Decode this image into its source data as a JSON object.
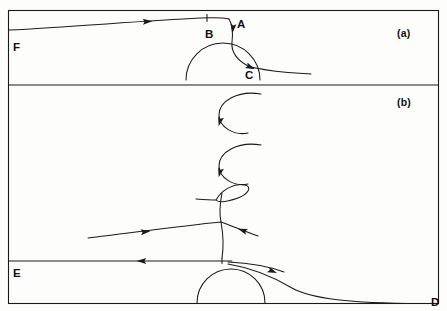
{
  "figure": {
    "background_color": "#fdfdfc",
    "line_color": "#1a1a1a",
    "frame": {
      "x": 8,
      "y": 10,
      "width": 431,
      "height": 294,
      "divider_y": 85
    }
  },
  "panels": [
    {
      "id": "a",
      "label": "(a)",
      "label_x": 397,
      "label_y": 28
    },
    {
      "id": "b",
      "label": "(b)",
      "label_x": 397,
      "label_y": 97
    }
  ],
  "point_labels": [
    {
      "name": "A",
      "text": "A",
      "x": 237,
      "y": 19,
      "panel": "a"
    },
    {
      "name": "B",
      "text": "B",
      "x": 205,
      "y": 29,
      "panel": "a"
    },
    {
      "name": "C",
      "text": "C",
      "x": 245,
      "y": 70,
      "panel": "a"
    },
    {
      "name": "D",
      "text": "D",
      "x": 431,
      "y": 297,
      "panel": "b"
    },
    {
      "name": "E",
      "text": "E",
      "x": 13,
      "y": 268,
      "panel": "b"
    },
    {
      "name": "F",
      "text": "F",
      "x": 13,
      "y": 42,
      "panel": "a"
    }
  ],
  "chart_data": {
    "type": "line",
    "xlabel": "",
    "ylabel": "",
    "grid": false,
    "legend": "none",
    "xlim": [
      8,
      439
    ],
    "ylim": [
      10,
      304
    ],
    "series": [
      {
        "name": "panel-a-incoming-streamline-F-to-B",
        "panel": "a",
        "description": "Nearly straight streamline entering at left edge at F, rising gently to the right toward B and the separation point A.",
        "path": "M 9 30 C 70 27, 140 21, 200 18 C 215 17.4, 224 17.6, 229 19",
        "arrow": {
          "x": 147,
          "y": 21.6,
          "angle": -3,
          "direction": "right"
        }
      },
      {
        "name": "panel-a-tick-at-B",
        "panel": "a",
        "description": "Short vertical tick mark crossing the streamline at point B.",
        "path": "M 207 14.5 L 207 21.5"
      },
      {
        "name": "panel-a-descending-stem-A-to-C",
        "panel": "a",
        "description": "Streamline turning sharply downward at A, descending past the bubble crest and curving to the right toward C.",
        "path": "M 229 19 C 233 25, 233 33, 232 42 C 231 52, 237 60, 248 66",
        "arrow": {
          "x": 233,
          "y": 28,
          "angle": 96,
          "direction": "down"
        }
      },
      {
        "name": "panel-a-separation-bubble",
        "panel": "a",
        "description": "Semicircular separation bubble sitting on the lower boundary of panel (a), spanning from x=186 to x=260.",
        "path": "M 186 80 A 37 37 0 0 1 260 80"
      },
      {
        "name": "panel-a-outgoing-streamline-C",
        "panel": "a",
        "description": "Streamline leaving the bubble at C and flattening out to the right, terminating short of the right frame edge.",
        "path": "M 248 66 C 258 69, 272 71, 288 72.5 C 297 73.3, 305 73.7, 311 73.9",
        "arrow": {
          "x": 250,
          "y": 67,
          "angle": 24,
          "direction": "right-down"
        }
      },
      {
        "name": "panel-b-upper-arc",
        "panel": "b",
        "description": "Upper C-shaped arc (open to the right) in panel (b), a rolled-up vortex filament.",
        "path": "M 261 94 C 238 90, 219 101, 219 115 C 219 127, 234 136, 248 133",
        "arrow": {
          "x": 220,
          "y": 121,
          "angle": 104,
          "direction": "down"
        }
      },
      {
        "name": "panel-b-middle-arc",
        "panel": "b",
        "description": "Middle C-shaped arc (open to the right) in panel (b), a second rolled-up vortex filament.",
        "path": "M 261 145 C 238 141, 219 152, 219 166 C 219 178, 234 187, 248 184",
        "arrow": {
          "x": 220,
          "y": 172,
          "angle": 104,
          "direction": "down"
        }
      },
      {
        "name": "panel-b-teardrop-loop",
        "panel": "b",
        "description": "Narrow teardrop-shaped loop tilted up to the right, formed where the sheet folds over on itself.",
        "path": "M 216 200 C 222 189, 235 183, 245 185 C 252 186.5, 249 194, 238 198 C 228 201.5, 219 203, 216 200 Z"
      },
      {
        "name": "panel-b-loop-inflow",
        "panel": "b",
        "description": "Line entering the teardrop loop from the left.",
        "path": "M 196 199 C 203 199.5, 210 200, 216 200"
      },
      {
        "name": "panel-b-loop-stem",
        "panel": "b",
        "description": "Stem descending from the teardrop loop down through the crossing point toward the lower bubble.",
        "path": "M 222 193 C 220 203, 219 213, 221 222 C 223 233, 224 245, 222 258"
      },
      {
        "name": "panel-b-long-incoming-line",
        "panel": "b",
        "description": "Long, nearly straight streamline entering from the left of panel (b) and rising to the crossing point below the loop.",
        "path": "M 88 238 C 130 233, 180 226, 221 222",
        "arrow": {
          "x": 145,
          "y": 231.8,
          "angle": -6,
          "direction": "right"
        }
      },
      {
        "name": "panel-b-right-branch",
        "panel": "b",
        "description": "Short branch leaving the crossing point toward the lower right, carrying a leftward-pointing arrowhead.",
        "path": "M 221 222 C 232 226, 244 231, 258 236",
        "arrow": {
          "x": 243,
          "y": 230.5,
          "angle": 200,
          "direction": "left"
        }
      },
      {
        "name": "panel-b-E-horizontal-line",
        "panel": "b",
        "description": "Horizontal streamline along the top of the lower bubble running to the left edge at E, with a left-pointing arrowhead.",
        "path": "M 9 261 L 232 261",
        "arrow": {
          "x": 142,
          "y": 261,
          "angle": 180,
          "direction": "left"
        }
      },
      {
        "name": "panel-b-tick-on-E-line",
        "panel": "b",
        "description": "Small tick mark on the E streamline just above the crest of the lower bubble.",
        "path": "M 222 258 L 222 263.5"
      },
      {
        "name": "panel-b-lower-bubble",
        "panel": "b",
        "description": "Large semicircular separation bubble resting on the bottom frame of panel (b), spanning x=197 to x=265.",
        "path": "M 197 303 A 34 34 0 0 1 265 303"
      },
      {
        "name": "panel-b-cusp-upper",
        "panel": "b",
        "description": "Upper edge of the thin lens/cusp shape emerging to the upper right of the lower bubble.",
        "path": "M 228 262 C 248 263, 268 266, 284 272"
      },
      {
        "name": "panel-b-cusp-lower-to-D",
        "panel": "b",
        "description": "Lower edge of the cusp sweeping down and to the right, asymptotically approaching the bottom frame at D.",
        "path": "M 228 264 C 252 268, 272 276, 292 288 C 312 299, 350 303, 420 303.5",
        "arrow": {
          "x": 272,
          "y": 271,
          "angle": 22,
          "direction": "right-down"
        }
      }
    ],
    "annotations": [
      {
        "text": "(a)",
        "x": 397,
        "y": 28
      },
      {
        "text": "(b)",
        "x": 397,
        "y": 97
      },
      {
        "text": "A",
        "x": 237,
        "y": 19
      },
      {
        "text": "B",
        "x": 205,
        "y": 29
      },
      {
        "text": "C",
        "x": 245,
        "y": 70
      },
      {
        "text": "D",
        "x": 431,
        "y": 297
      },
      {
        "text": "E",
        "x": 13,
        "y": 268
      },
      {
        "text": "F",
        "x": 13,
        "y": 42
      }
    ]
  }
}
